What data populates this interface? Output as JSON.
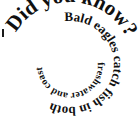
{
  "image": {
    "kind": "spiral-text-graphic",
    "width": 140,
    "height": 132,
    "background_color": "#ffffff",
    "text_color": "#101010"
  },
  "spiral": {
    "full_text": "Did you know? Bald eagles catch fish in both freshwater and coastal areas.",
    "direction": "clockwise-inward",
    "turns": 2.5,
    "segments": [
      {
        "id": "outer",
        "text": "Did you know?",
        "font_size": 21,
        "order": 1
      },
      {
        "id": "middle",
        "text": "Bald eagles catch fish in both",
        "font_size": 13,
        "order": 2
      },
      {
        "id": "inner",
        "text": "freshwater and coastal areas.",
        "font_size": 10,
        "order": 3
      }
    ]
  }
}
